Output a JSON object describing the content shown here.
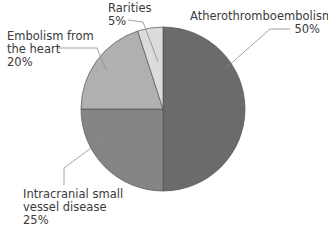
{
  "chart_data": {
    "type": "pie",
    "title": "",
    "categories": [
      "Atherothromboembolism",
      "Intracranial small vessel disease",
      "Embolism from the heart",
      "Rarities"
    ],
    "values": [
      50,
      25,
      20,
      5
    ],
    "unit": "%",
    "colors": [
      "#6b6b6b",
      "#858585",
      "#b0b0b0",
      "#dcdcdc"
    ],
    "start_angle": "12 o'clock, clockwise",
    "legend": "none (callout labels)"
  },
  "labels": {
    "athero": {
      "line1": "Atherothromboembolism",
      "pct": "50%"
    },
    "small_vessel": {
      "line1": "Intracranial small",
      "line2": "vessel disease",
      "pct": "25%"
    },
    "cardiac": {
      "line1": "Embolism from",
      "line2": "the heart",
      "pct": "20%"
    },
    "rarities": {
      "line1": "Rarities",
      "pct": "5%"
    }
  }
}
